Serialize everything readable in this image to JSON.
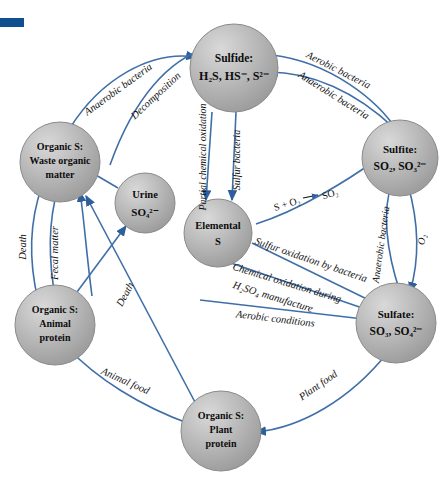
{
  "figure": {
    "accent_color": "#3f6fa8",
    "node_fill": "#b8b8b8",
    "corner_mark_color": "#10508f"
  },
  "nodes": {
    "sulfide": {
      "line1": "Sulfide:",
      "line2": "H₂S, HS⁻, S²⁻"
    },
    "sulfite": {
      "line1": "Sulfite:",
      "line2": "SO₂, SO₃²⁻"
    },
    "sulfate": {
      "line1": "Sulfate:",
      "line2": "SO₃, SO₄²⁻"
    },
    "elemental": {
      "line1": "Elemental",
      "line2": "S"
    },
    "urine": {
      "line1": "Urine",
      "line2": "SO₄²⁻"
    },
    "waste_organic": {
      "line1": "Organic S:",
      "line2": "Waste organic",
      "line3": "matter"
    },
    "animal_protein": {
      "line1": "Organic S:",
      "line2": "Animal",
      "line3": "protein"
    },
    "plant_protein": {
      "line1": "Organic S:",
      "line2": "Plant",
      "line3": "protein"
    }
  },
  "edge_labels": {
    "anaerobic_bacteria_top_left": "Anaerobic bacteria",
    "decomposition": "Decomposition",
    "aerobic_bacteria_top_right": "Aerobic bacteria",
    "anaerobic_bacteria_top_right": "Anaerobic bacteria",
    "partial_chemical_oxidation": "Partial chemical oxidation",
    "sulfur_bacteria": "Sulfur bacteria",
    "s_plus_o2": "S + O₂",
    "so2": "SO₂",
    "anaerobic_bacteria_right": "Anaerobic bacteria",
    "oxygen": "O₂",
    "sulfur_oxidation_by_bacteria": "Sulfur oxidation by bacteria",
    "chemical_oxidation_during": "Chemical oxidation during",
    "h2so4_manufacture": "H₂SO₄ manufacture",
    "aerobic_conditions": "Aerobic conditions",
    "death_left": "Death",
    "fecal_matter": "Fecal matter",
    "death_center": "Death",
    "animal_food": "Animal food",
    "plant_food": "Plant food"
  }
}
